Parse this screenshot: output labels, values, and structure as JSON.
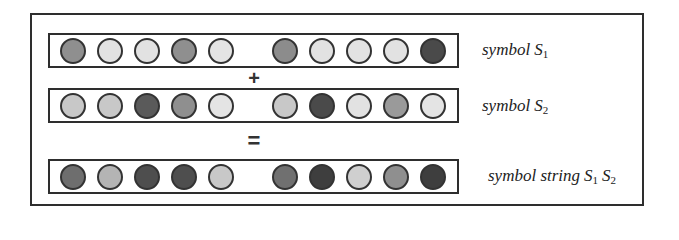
{
  "diagram": {
    "frame_color": "#2e2e2e",
    "palette": {
      "light": "#e2e2e2",
      "light_medium": "#c4c4c4",
      "medium": "#8f8f8f",
      "medium_dark": "#777777",
      "dark": "#4a4a4a",
      "darkest": "#3a3a3a"
    },
    "rows": [
      {
        "id": "s1",
        "label_word": "symbol",
        "label_var": "S",
        "label_sub": "1",
        "circles_left": [
          "#8f8f8f",
          "#e2e2e2",
          "#e2e2e2",
          "#8f8f8f",
          "#e4e4e4"
        ],
        "circles_right": [
          "#8c8c8c",
          "#e2e2e2",
          "#e2e2e2",
          "#e2e2e2",
          "#4a4a4a"
        ]
      },
      {
        "id": "s2",
        "label_word": "symbol",
        "label_var": "S",
        "label_sub": "2",
        "circles_left": [
          "#c8c8c8",
          "#c8c8c8",
          "#5a5a5a",
          "#8f8f8f",
          "#e4e4e4"
        ],
        "circles_right": [
          "#c8c8c8",
          "#4a4a4a",
          "#e2e2e2",
          "#9a9a9a",
          "#e4e4e4"
        ]
      },
      {
        "id": "s1s2",
        "label_word": "symbol string",
        "label_var1": "S",
        "label_sub1": "1",
        "label_var2": "S",
        "label_sub2": "2",
        "circles_left": [
          "#6e6e6e",
          "#b4b4b4",
          "#4e4e4e",
          "#4e4e4e",
          "#c8c8c8"
        ],
        "circles_right": [
          "#707070",
          "#3e3e3e",
          "#cfcfcf",
          "#8f8f8f",
          "#3e3e3e"
        ]
      }
    ],
    "operators": {
      "plus": "+",
      "equals": "="
    }
  }
}
